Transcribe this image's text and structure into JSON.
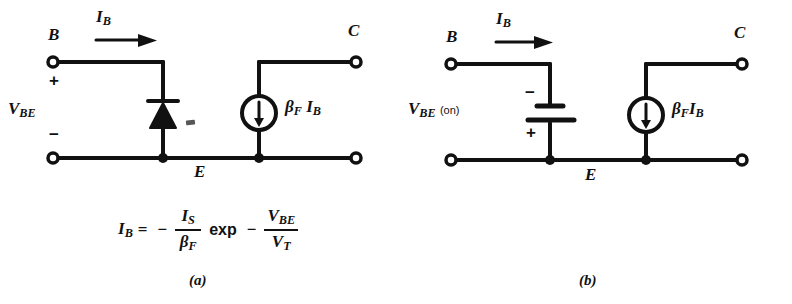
{
  "figure": {
    "panels": [
      {
        "id": "a",
        "caption": "(a)",
        "terminals": {
          "base": "B",
          "collector": "C",
          "emitter": "E"
        },
        "current_label": {
          "symbol": "I",
          "subscript": "B"
        },
        "voltage_label": {
          "symbol": "V",
          "subscript": "BE",
          "suffix": ""
        },
        "polarity": {
          "top": "+",
          "bottom": "−"
        },
        "source_label": {
          "beta": "β",
          "beta_sub": "F",
          "current": "I",
          "current_sub": "B"
        },
        "element": "diode",
        "equation": {
          "lhs": {
            "symbol": "I",
            "subscript": "B"
          },
          "equals": "=",
          "minus1": "−",
          "frac1": {
            "num": "I",
            "num_sub": "S",
            "den": "β",
            "den_sub": "F"
          },
          "exp": "exp",
          "minus2": "−",
          "frac2": {
            "num": "V",
            "num_sub": "BE",
            "den": "V",
            "den_sub": "T"
          }
        }
      },
      {
        "id": "b",
        "caption": "(b)",
        "terminals": {
          "base": "B",
          "collector": "C",
          "emitter": "E"
        },
        "current_label": {
          "symbol": "I",
          "subscript": "B"
        },
        "voltage_label": {
          "symbol": "V",
          "subscript": "BE",
          "suffix": "(on)"
        },
        "polarity": {
          "top": "−",
          "bottom": "+"
        },
        "source_label": {
          "beta": "β",
          "beta_sub": "F",
          "current": "I",
          "current_sub": "B"
        },
        "element": "battery"
      }
    ],
    "colors": {
      "ink": "#111111",
      "paper": "#ffffff"
    }
  }
}
